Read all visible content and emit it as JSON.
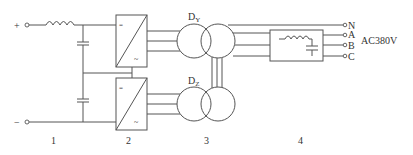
{
  "diagram": {
    "colors": {
      "line": "#555555",
      "text": "#333333",
      "background": "#ffffff"
    },
    "input_terminals": {
      "positive": "+",
      "negative": "−"
    },
    "converter_symbols": {
      "dc": "=",
      "ac": "~"
    },
    "transformers": {
      "top_label": "D",
      "top_sub": "Y",
      "bottom_label": "D",
      "bottom_sub": "Z"
    },
    "output_terminals": [
      "N",
      "A",
      "B",
      "C"
    ],
    "output_voltage": "AC380V",
    "section_labels": [
      "1",
      "2",
      "3",
      "4"
    ]
  }
}
